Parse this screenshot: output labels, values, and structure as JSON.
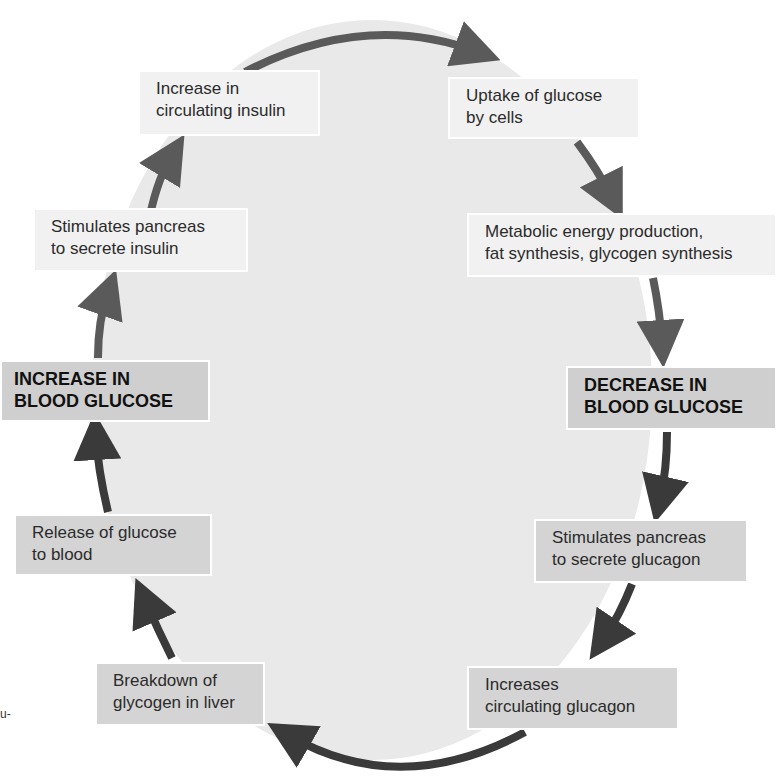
{
  "diagram": {
    "type": "cycle",
    "topic": "Blood glucose regulation by insulin and glucagon",
    "colors": {
      "background_oval": "#e9e9e9",
      "insulin_arrow": "#5a5a5a",
      "glucagon_arrow": "#3a3a3a",
      "light_box": "#f1f1f1",
      "dark_box": "#d4d4d4",
      "key_box": "#cfcfcf"
    },
    "nodes": {
      "increase_insulin": {
        "line1": "Increase in",
        "line2": "circulating insulin"
      },
      "uptake_glucose": {
        "line1": "Uptake of glucose",
        "line2": "by cells"
      },
      "stimulates_insulin": {
        "line1": "Stimulates pancreas",
        "line2": "to secrete insulin"
      },
      "metabolic": {
        "line1": "Metabolic energy production,",
        "line2": "fat synthesis, glycogen synthesis"
      },
      "increase_blood_glucose": {
        "line1": "INCREASE IN",
        "line2": "BLOOD GLUCOSE"
      },
      "decrease_blood_glucose": {
        "line1": "DECREASE IN",
        "line2": "BLOOD GLUCOSE"
      },
      "release_glucose": {
        "line1": "Release of glucose",
        "line2": "to blood"
      },
      "stimulates_glucagon": {
        "line1": "Stimulates pancreas",
        "line2": "to secrete glucagon"
      },
      "breakdown_glycogen": {
        "line1": "Breakdown of",
        "line2": "glycogen in liver"
      },
      "increases_glucagon": {
        "line1": "Increases",
        "line2": "circulating glucagon"
      }
    },
    "edges": [
      {
        "from": "increase_blood_glucose",
        "to": "stimulates_insulin"
      },
      {
        "from": "stimulates_insulin",
        "to": "increase_insulin"
      },
      {
        "from": "increase_insulin",
        "to": "uptake_glucose"
      },
      {
        "from": "uptake_glucose",
        "to": "metabolic"
      },
      {
        "from": "metabolic",
        "to": "decrease_blood_glucose"
      },
      {
        "from": "decrease_blood_glucose",
        "to": "stimulates_glucagon"
      },
      {
        "from": "stimulates_glucagon",
        "to": "increases_glucagon"
      },
      {
        "from": "increases_glucagon",
        "to": "breakdown_glycogen"
      },
      {
        "from": "breakdown_glycogen",
        "to": "release_glucose"
      },
      {
        "from": "release_glucose",
        "to": "increase_blood_glucose"
      }
    ],
    "edge_fragment_text": "u-"
  }
}
